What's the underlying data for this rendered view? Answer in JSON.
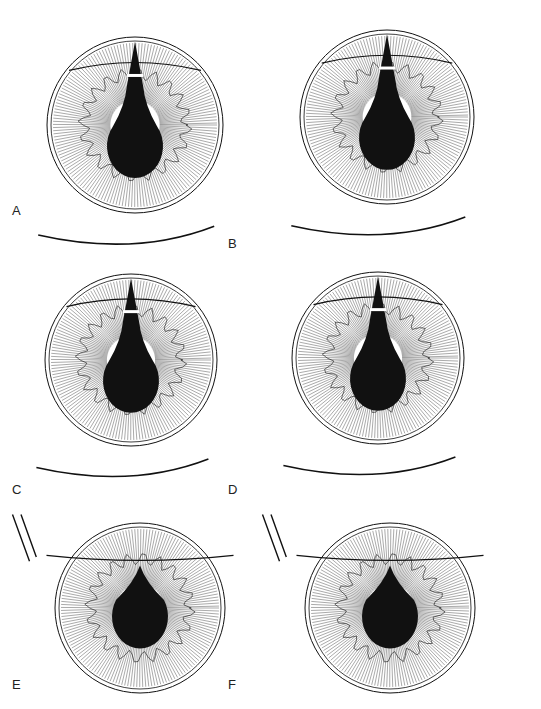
{
  "figure": {
    "panels": [
      {
        "label": "A",
        "cx": 135,
        "cy": 125,
        "r": 88,
        "label_x": 12,
        "label_y": 203,
        "pupil_stage": "keyhole"
      },
      {
        "label": "B",
        "cx": 387,
        "cy": 117,
        "r": 87,
        "label_x": 228,
        "label_y": 236,
        "pupil_stage": "keyhole"
      },
      {
        "label": "C",
        "cx": 131,
        "cy": 360,
        "r": 86,
        "label_x": 12,
        "label_y": 482,
        "pupil_stage": "keyhole"
      },
      {
        "label": "D",
        "cx": 378,
        "cy": 358,
        "r": 86,
        "label_x": 228,
        "label_y": 482,
        "pupil_stage": "keyhole"
      },
      {
        "label": "E",
        "cx": 140,
        "cy": 608,
        "r": 85,
        "label_x": 12,
        "label_y": 677,
        "pupil_stage": "round"
      },
      {
        "label": "F",
        "cx": 390,
        "cy": 608,
        "r": 85,
        "label_x": 228,
        "label_y": 677,
        "pupil_stage": "round"
      }
    ],
    "colors": {
      "ink": "#111111",
      "paper": "#ffffff",
      "iris_line": "#555555"
    }
  }
}
